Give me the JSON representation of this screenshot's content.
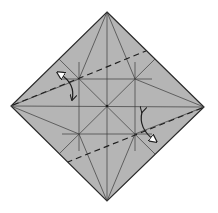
{
  "diagram": {
    "type": "origami-crease-pattern",
    "colors": {
      "background": "#ffffff",
      "paper_fill": "#b5b5b5",
      "edge": "#2a2a2a",
      "crease": "#3a3a3a",
      "valley_fold": "#1e1e1e",
      "arrow": "#1e1e1e",
      "arrowhead_open": "#ffffff"
    },
    "square": {
      "top": [
        107,
        12
      ],
      "right": [
        204,
        107
      ],
      "bottom": [
        107,
        201
      ],
      "left": [
        11,
        106
      ]
    },
    "center": [
      107,
      106
    ],
    "inner_points": {
      "upper_left": [
        79,
        79
      ],
      "upper_right": [
        135,
        79
      ],
      "lower_left": [
        79,
        134
      ],
      "lower_right": [
        135,
        134
      ]
    },
    "valley_folds": [
      {
        "from": [
          11,
          106
        ],
        "to": [
          146,
          51
        ]
      },
      {
        "from": [
          204,
          107
        ],
        "to": [
          68,
          162
        ]
      }
    ],
    "fold_arrows": [
      {
        "position": "upper-left",
        "direction": "fold-and-unfold"
      },
      {
        "position": "lower-right",
        "direction": "fold-and-unfold"
      }
    ]
  }
}
